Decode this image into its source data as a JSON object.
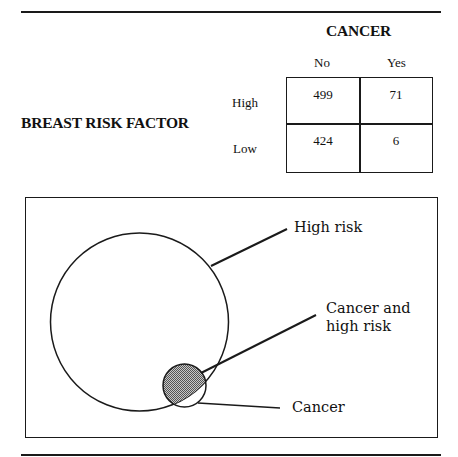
{
  "table": {
    "column_header": "CANCER",
    "row_header": "BREAST RISK FACTOR",
    "columns": [
      "No",
      "Yes"
    ],
    "rows": [
      {
        "label": "High",
        "values": [
          "499",
          "71"
        ]
      },
      {
        "label": "Low",
        "values": [
          "424",
          "6"
        ]
      }
    ]
  },
  "diagram": {
    "labels": {
      "high_risk": "High risk",
      "cancer_and_high_risk_line1": "Cancer and",
      "cancer_and_high_risk_line2": "high risk",
      "cancer": "Cancer"
    },
    "colors": {
      "stroke": "#1a1a1a",
      "intersection_fill": "#9a9a9a"
    }
  }
}
